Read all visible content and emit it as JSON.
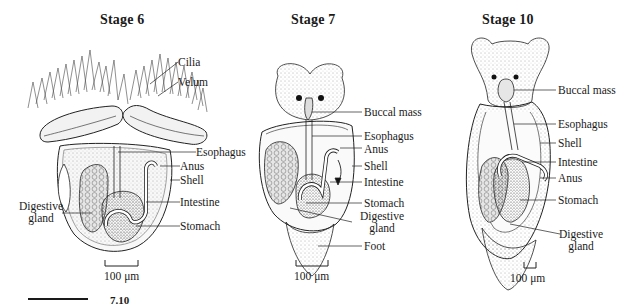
{
  "figure": {
    "panels": [
      {
        "id": "stage6",
        "title": "Stage 6",
        "labels": [
          "Cilia",
          "Velum",
          "Esophagus",
          "Anus",
          "Shell",
          "Intestine",
          "Stomach"
        ],
        "left_labels": [
          "Digestive gland"
        ],
        "scale_bar": "100 μm"
      },
      {
        "id": "stage7",
        "title": "Stage 7",
        "labels": [
          "Buccal mass",
          "Esophagus",
          "Anus",
          "Shell",
          "Intestine",
          "Stomach",
          "Digestive gland",
          "Foot"
        ],
        "scale_bar": "100 μm"
      },
      {
        "id": "stage10",
        "title": "Stage 10",
        "labels": [
          "Buccal mass",
          "Esophagus",
          "Shell",
          "Intestine",
          "Anus",
          "Stomach",
          "Digestive gland"
        ],
        "scale_bar": "100 μm"
      }
    ],
    "text": {
      "s6_title": "Stage 6",
      "s7_title": "Stage 7",
      "s10_title": "Stage 10",
      "s6_cilia": "Cilia",
      "s6_velum": "Velum",
      "s6_esophagus": "Esophagus",
      "s6_anus": "Anus",
      "s6_shell": "Shell",
      "s6_intestine": "Intestine",
      "s6_stomach": "Stomach",
      "s6_dg1": "Digestive",
      "s6_dg2": "gland",
      "s6_scale": "100 μm",
      "s7_buccal": "Buccal mass",
      "s7_esophagus": "Esophagus",
      "s7_anus": "Anus",
      "s7_shell": "Shell",
      "s7_intestine": "Intestine",
      "s7_stomach": "Stomach",
      "s7_dg1": "Digestive",
      "s7_dg2": "gland",
      "s7_foot": "Foot",
      "s7_scale": "100 μm",
      "s10_buccal": "Buccal mass",
      "s10_esophagus": "Esophagus",
      "s10_shell": "Shell",
      "s10_intestine": "Intestine",
      "s10_anus": "Anus",
      "s10_stomach": "Stomach",
      "s10_dg1": "Digestive",
      "s10_dg2": "gland",
      "s10_scale": "100 μm",
      "caption_fragment": "7.10"
    }
  }
}
